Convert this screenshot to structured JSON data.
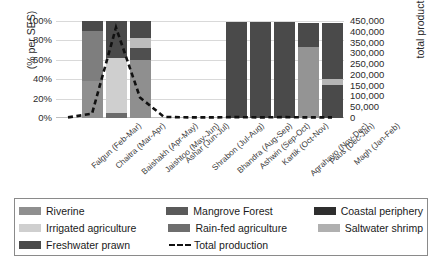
{
  "chart_data": {
    "type": "bar",
    "title": "",
    "subtitle": "",
    "ylabel": "(% per SES)",
    "ylabel_right": "total production (kg)",
    "xlabel": "",
    "grid": true,
    "legend_position": "bottom",
    "ylim": [
      0,
      100
    ],
    "ylim_right": [
      0,
      450000
    ],
    "ytick_labels": [
      "100%",
      "80%",
      "60%",
      "40%",
      "20%",
      "0%"
    ],
    "ytick_values": [
      100,
      80,
      60,
      40,
      20,
      0
    ],
    "ytick_right_labels": [
      "450,000",
      "400,000",
      "350,000",
      "300,000",
      "250,000",
      "200,000",
      "150,000",
      "100,000",
      "50,000",
      "0"
    ],
    "ytick_right_values": [
      450000,
      400000,
      350000,
      300000,
      250000,
      200000,
      150000,
      100000,
      50000,
      0
    ],
    "categories": [
      "Falgun (Feb-Mar)",
      "Chaitra (Mar-Apr)",
      "Baishakh (Apr-May)",
      "Jaishtoo (May-Jun)",
      "Ashar (Jun-Jul)",
      "Shrabon (Jul-Aug)",
      "Bhandra (Aug-Sep)",
      "Ashwin (Sep-Oct)",
      "Kartik (Oct-Nov)",
      "Agrahayo (Nov-Dec)",
      "Paus (Dec-Jan)",
      "Magh (Jan-Feb)"
    ],
    "series": [
      {
        "name": "Riverine",
        "color": "#8c8c8c",
        "values": [
          0,
          0,
          0,
          60,
          0,
          0,
          0,
          0,
          0,
          0,
          73,
          0
        ]
      },
      {
        "name": "Irrigated agriculture",
        "color": "#c6c6c6",
        "values": [
          0,
          0,
          57,
          0,
          0,
          0,
          0,
          0,
          0,
          0,
          0,
          0
        ]
      },
      {
        "name": "Freshwater prawn",
        "color": "#4d4d4d",
        "values": [
          0,
          0,
          0,
          0,
          0,
          0,
          0,
          0,
          0,
          0,
          0,
          0
        ]
      },
      {
        "name": "Mangrove Forest",
        "color": "#595959",
        "values": [
          0,
          0,
          0,
          0,
          0,
          0,
          0,
          0,
          0,
          0,
          0,
          0
        ]
      },
      {
        "name": "Rain-fed agriculture",
        "color": "#6e6e6e",
        "values": [
          0,
          90,
          0,
          0,
          0,
          0,
          0,
          0,
          0,
          0,
          0,
          0
        ]
      },
      {
        "name": "Saltwater shrimp",
        "color": "#a8a8a8",
        "values": [
          0,
          0,
          0,
          10,
          0,
          0,
          0,
          0,
          0,
          0,
          0,
          6
        ]
      },
      {
        "name": "Coastal periphery",
        "color": "#3d3d3d",
        "values": [
          0,
          10,
          43,
          30,
          0,
          0,
          0,
          99,
          99,
          99,
          25,
          92
        ]
      }
    ],
    "stacks": [
      {
        "category": "Falgun (Feb-Mar)",
        "segments": []
      },
      {
        "category": "Chaitra (Mar-Apr)",
        "segments": [
          {
            "series": "Rain-fed agriculture",
            "color": "#8f8f8f",
            "from": 0,
            "to": 38
          },
          {
            "series": "Rain-fed agriculture",
            "color": "#7e7e7e",
            "from": 38,
            "to": 90
          },
          {
            "series": "Coastal periphery",
            "color": "#4a4a4a",
            "from": 90,
            "to": 100
          }
        ]
      },
      {
        "category": "Baishakh (Apr-May)",
        "segments": [
          {
            "series": "Freshwater prawn",
            "color": "#6b6b6b",
            "from": 0,
            "to": 5
          },
          {
            "series": "Irrigated agriculture",
            "color": "#cfcfcf",
            "from": 5,
            "to": 62
          },
          {
            "series": "Coastal periphery",
            "color": "#4a4a4a",
            "from": 62,
            "to": 100
          }
        ]
      },
      {
        "category": "Jaishtoo (May-Jun)",
        "segments": [
          {
            "series": "Riverine",
            "color": "#8f8f8f",
            "from": 0,
            "to": 60
          },
          {
            "series": "Mangrove Forest",
            "color": "#4f4f4f",
            "from": 60,
            "to": 72
          },
          {
            "series": "Saltwater shrimp",
            "color": "#bdbdbd",
            "from": 72,
            "to": 82
          },
          {
            "series": "Coastal periphery",
            "color": "#4a4a4a",
            "from": 82,
            "to": 100
          }
        ]
      },
      {
        "category": "Ashar (Jun-Jul)",
        "segments": []
      },
      {
        "category": "Shrabon (Jul-Aug)",
        "segments": []
      },
      {
        "category": "Bhandra (Aug-Sep)",
        "segments": []
      },
      {
        "category": "Ashwin (Sep-Oct)",
        "segments": [
          {
            "series": "Coastal periphery",
            "color": "#4a4a4a",
            "from": 0,
            "to": 99
          }
        ]
      },
      {
        "category": "Kartik (Oct-Nov)",
        "segments": [
          {
            "series": "Coastal periphery",
            "color": "#4a4a4a",
            "from": 0,
            "to": 99
          }
        ]
      },
      {
        "category": "Agrahayo (Nov-Dec)",
        "segments": [
          {
            "series": "Coastal periphery",
            "color": "#4a4a4a",
            "from": 0,
            "to": 99
          }
        ]
      },
      {
        "category": "Paus (Dec-Jan)",
        "segments": [
          {
            "series": "Riverine",
            "color": "#949494",
            "from": 0,
            "to": 73
          },
          {
            "series": "Coastal periphery",
            "color": "#4a4a4a",
            "from": 73,
            "to": 98
          }
        ]
      },
      {
        "category": "Magh (Jan-Feb)",
        "segments": [
          {
            "series": "Coastal periphery",
            "color": "#4a4a4a",
            "from": 0,
            "to": 34
          },
          {
            "series": "Saltwater shrimp",
            "color": "#b5b5b5",
            "from": 34,
            "to": 40
          },
          {
            "series": "Coastal periphery",
            "color": "#4a4a4a",
            "from": 40,
            "to": 98
          }
        ]
      }
    ],
    "line_series": {
      "name": "Total production",
      "style": "dashed",
      "color": "#111111",
      "axis": "right",
      "values": [
        3000,
        20000,
        420000,
        95000,
        5000,
        3000,
        3000,
        4000,
        3000,
        4000,
        3000,
        3000
      ]
    }
  },
  "legend": {
    "entries": [
      {
        "label": "Riverine",
        "color": "#8f8f8f",
        "type": "swatch"
      },
      {
        "label": "Mangrove Forest",
        "color": "#5a5a5a",
        "type": "swatch"
      },
      {
        "label": "Coastal periphery",
        "color": "#2e2e2e",
        "type": "swatch"
      },
      {
        "label": "Irrigated agriculture",
        "color": "#cfcfcf",
        "type": "swatch"
      },
      {
        "label": "Rain-fed agriculture",
        "color": "#6e6e6e",
        "type": "swatch"
      },
      {
        "label": "Saltwater shrimp",
        "color": "#b0b0b0",
        "type": "swatch"
      },
      {
        "label": "Freshwater prawn",
        "color": "#4a4a4a",
        "type": "swatch"
      },
      {
        "label": "Total production",
        "color": "#111111",
        "type": "dashed-line"
      }
    ]
  }
}
